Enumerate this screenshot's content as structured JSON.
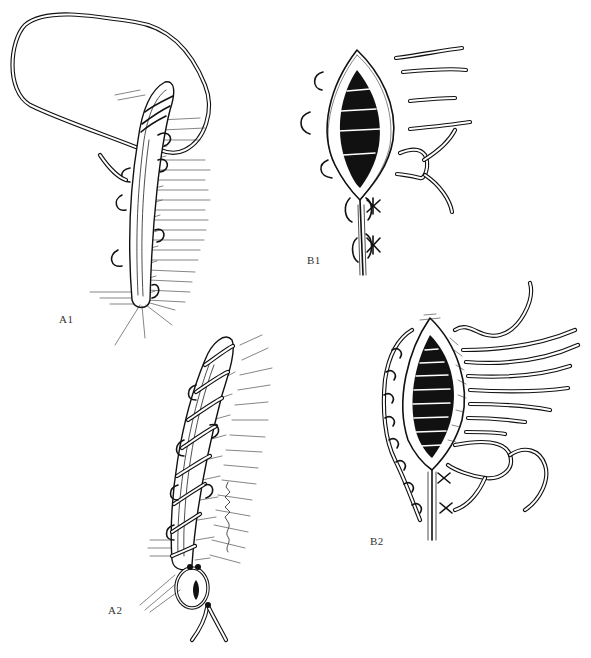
{
  "figure": {
    "type": "surgical-illustration",
    "style": "black-and-white pen-and-ink",
    "panels": [
      {
        "id": "A1",
        "label": "A1",
        "description": "Continuous suture with thread loop over tubular structure, knot at base"
      },
      {
        "id": "B1",
        "label": "B1",
        "description": "Open elliptical wound with interrupted sutures placed; two tied knots below"
      },
      {
        "id": "A2",
        "label": "A2",
        "description": "Completed spiral/continuous suture wrapped along tubular structure, tied at base"
      },
      {
        "id": "B2",
        "label": "B2",
        "description": "Elliptical wound with multiple sutures placed, needle at top, partial closure below"
      }
    ],
    "signature": {
      "present": true,
      "orientation": "vertical",
      "location": "panel A2, right side"
    },
    "colors": {
      "ink": "#111111",
      "background": "#ffffff",
      "label": "#333333"
    }
  }
}
